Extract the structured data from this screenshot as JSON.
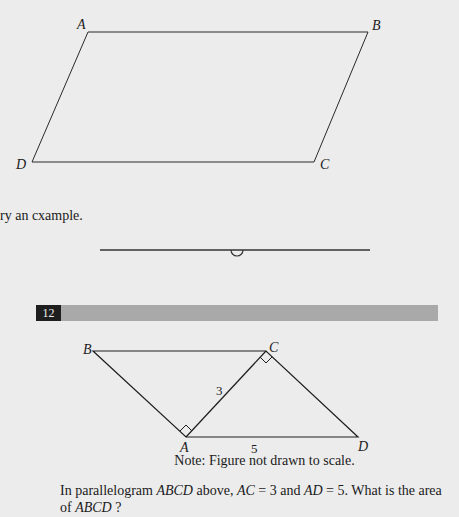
{
  "figure_top": {
    "vertices": {
      "A": "A",
      "B": "B",
      "C": "C",
      "D": "D"
    }
  },
  "snippet_text": "ry an cxample.",
  "question": {
    "number": "12",
    "figure": {
      "vertices": {
        "A": "A",
        "B": "B",
        "C": "C",
        "D": "D"
      },
      "side_AC_label": "3",
      "side_AD_label": "5"
    },
    "note": "Note: Figure not drawn to scale.",
    "text_parts": {
      "p1": "In parallelogram ",
      "abcd1": "ABCD",
      "p2": " above, ",
      "ac": "AC",
      "p3": " = 3 and ",
      "ad": "AD",
      "p4": " = 5. What is the area of ",
      "abcd2": "ABCD",
      "p5": " ?"
    }
  },
  "colors": {
    "background": "#ececec",
    "bar": "#a9a9a9",
    "number_box": "#1e1e1e",
    "ink": "#1a1a1a"
  }
}
